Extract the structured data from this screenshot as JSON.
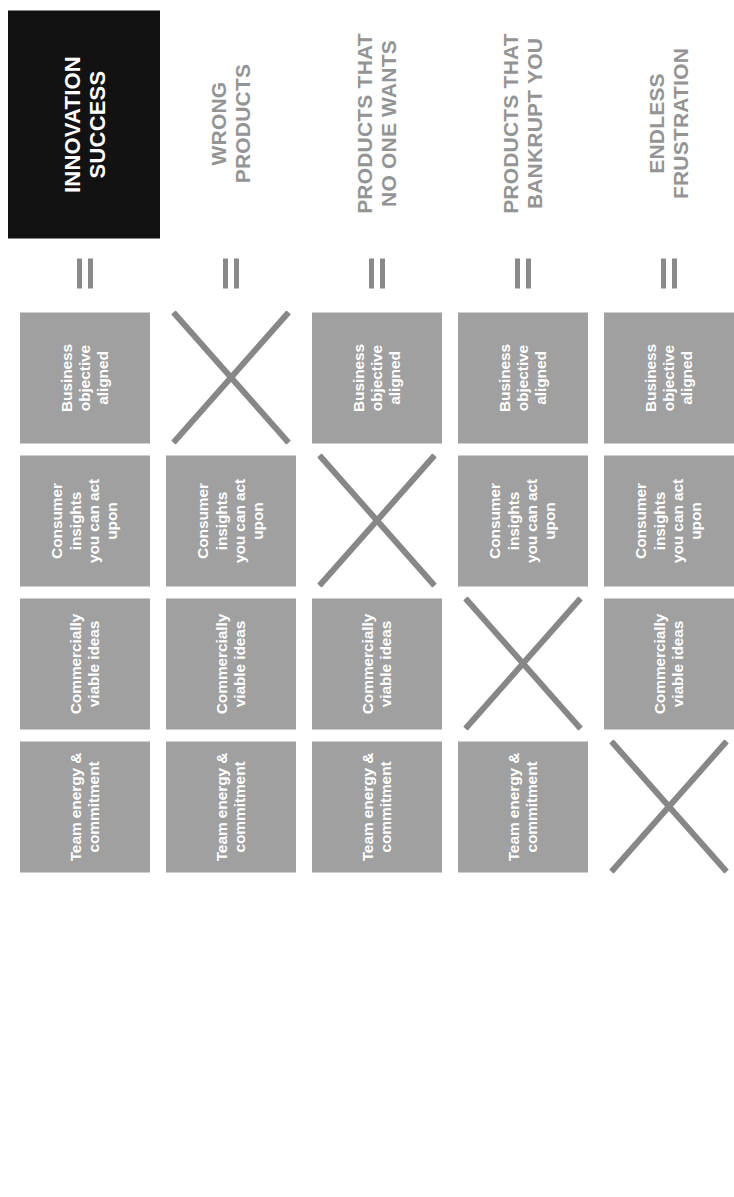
{
  "diagram": {
    "ingredients": [
      "Business objective\naligned",
      "Consumer insights\nyou can act upon",
      "Commercially\nviable ideas",
      "Team energy &\ncommitment"
    ],
    "equals_symbol": "=",
    "missing_marker": "x-cross",
    "colors": {
      "box_fill": "#a0a0a0",
      "box_text": "#ffffff",
      "hero_fill": "#121212",
      "hero_text": "#ffffff",
      "outcome_text": "#949494",
      "cross_stroke": "#878787",
      "background": "#ffffff"
    },
    "rows": [
      {
        "outcome": "INNOVATION\nSUCCESS",
        "hero": true,
        "cells": [
          {
            "kind": "box",
            "label": "Business objective\naligned"
          },
          {
            "kind": "box",
            "label": "Consumer insights\nyou can act upon"
          },
          {
            "kind": "box",
            "label": "Commercially\nviable ideas"
          },
          {
            "kind": "box",
            "label": "Team energy &\ncommitment"
          }
        ]
      },
      {
        "outcome": "WRONG\nPRODUCTS",
        "hero": false,
        "cells": [
          {
            "kind": "cross",
            "label": ""
          },
          {
            "kind": "box",
            "label": "Consumer insights\nyou can act upon"
          },
          {
            "kind": "box",
            "label": "Commercially\nviable ideas"
          },
          {
            "kind": "box",
            "label": "Team energy &\ncommitment"
          }
        ]
      },
      {
        "outcome": "PRODUCTS THAT\nNO ONE WANTS",
        "hero": false,
        "cells": [
          {
            "kind": "box",
            "label": "Business objective\naligned"
          },
          {
            "kind": "cross",
            "label": ""
          },
          {
            "kind": "box",
            "label": "Commercially\nviable ideas"
          },
          {
            "kind": "box",
            "label": "Team energy &\ncommitment"
          }
        ]
      },
      {
        "outcome": "PRODUCTS THAT\nBANKRUPT YOU",
        "hero": false,
        "cells": [
          {
            "kind": "box",
            "label": "Business objective\naligned"
          },
          {
            "kind": "box",
            "label": "Consumer insights\nyou can act upon"
          },
          {
            "kind": "cross",
            "label": ""
          },
          {
            "kind": "box",
            "label": "Team energy &\ncommitment"
          }
        ]
      },
      {
        "outcome": "ENDLESS\nFRUSTRATION",
        "hero": false,
        "cells": [
          {
            "kind": "box",
            "label": "Business objective\naligned"
          },
          {
            "kind": "box",
            "label": "Consumer insights\nyou can act upon"
          },
          {
            "kind": "box",
            "label": "Commercially\nviable ideas"
          },
          {
            "kind": "cross",
            "label": ""
          }
        ]
      }
    ]
  }
}
